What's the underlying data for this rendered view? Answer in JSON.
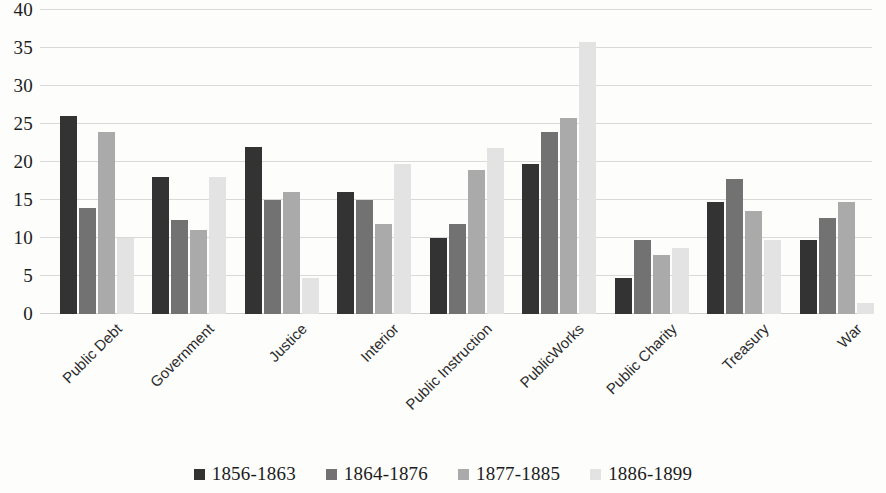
{
  "chart_data": {
    "type": "bar",
    "title": "",
    "subtitle": "",
    "xlabel": "",
    "ylabel": "",
    "ylim": [
      0,
      40
    ],
    "y_ticks": [
      0,
      5,
      10,
      15,
      20,
      25,
      30,
      35,
      40
    ],
    "grid": true,
    "legend_position": "bottom",
    "categories": [
      "Public Debt",
      "Government",
      "Justice",
      "Interior",
      "Public Instruction",
      "PublicWorks",
      "Public Charity",
      "Treasury",
      "War"
    ],
    "series": [
      {
        "name": "1856-1863",
        "color": "#333333",
        "values": [
          26.0,
          18.0,
          22.0,
          16.0,
          10.0,
          19.8,
          4.8,
          14.8,
          9.8
        ]
      },
      {
        "name": "1864-1876",
        "color": "#727272",
        "values": [
          14.0,
          12.4,
          15.0,
          15.0,
          11.8,
          23.9,
          9.8,
          17.8,
          12.6
        ]
      },
      {
        "name": "1877-1885",
        "color": "#aaaaaa",
        "values": [
          24.0,
          11.0,
          16.0,
          11.8,
          18.9,
          25.8,
          7.8,
          13.6,
          14.7
        ]
      },
      {
        "name": "1886-1899",
        "color": "#e3e3e3",
        "values": [
          10.0,
          18.0,
          4.7,
          19.8,
          21.8,
          35.8,
          8.7,
          9.8,
          1.5
        ]
      }
    ]
  }
}
